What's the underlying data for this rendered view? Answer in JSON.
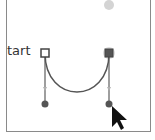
{
  "diagram": {
    "label": "tart",
    "colors": {
      "frame": "#8a8a8a",
      "path": "#555555",
      "anchor_fill_open": "#ffffff",
      "anchor_fill_selected": "#555555",
      "handle_point": "#555555",
      "ghost_point": "#d4d4d4",
      "cursor": "#111111"
    },
    "anchors": [
      {
        "name": "start-anchor",
        "x": 45,
        "y": 53,
        "state": "open"
      },
      {
        "name": "end-anchor",
        "x": 109,
        "y": 53,
        "state": "selected"
      }
    ],
    "handles": [
      {
        "name": "start-handle",
        "x": 45,
        "y": 104
      },
      {
        "name": "end-handle",
        "x": 109,
        "y": 104
      }
    ],
    "ghost_point": {
      "x": 109,
      "y": 5
    }
  }
}
